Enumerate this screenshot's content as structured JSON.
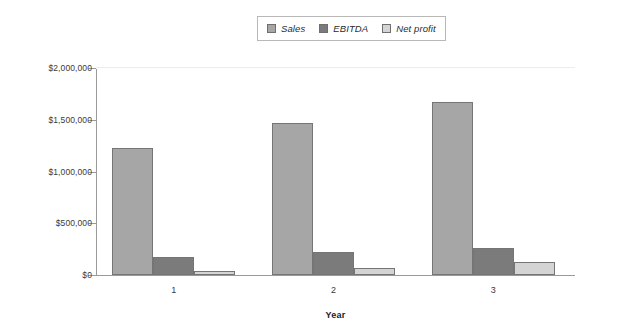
{
  "chart_data": {
    "type": "bar",
    "title": "",
    "xlabel": "Year",
    "ylabel": "",
    "categories": [
      "1",
      "2",
      "3"
    ],
    "series": [
      {
        "name": "Sales",
        "color": "#a6a6a6",
        "values": [
          1230000,
          1465000,
          1670000
        ]
      },
      {
        "name": "EBITDA",
        "color": "#7b7b7b",
        "values": [
          170000,
          225000,
          265000
        ]
      },
      {
        "name": "Net profit",
        "color": "#d4d4d4",
        "values": [
          40000,
          70000,
          125000
        ]
      }
    ],
    "ylim": [
      0,
      2000000
    ],
    "yticks": [
      0,
      500000,
      1000000,
      1500000,
      2000000
    ],
    "ytick_labels": [
      "$0",
      "$500,000",
      "$1,000,000",
      "$1,500,000",
      "$2,000,000"
    ],
    "gridlines": [
      2000000
    ],
    "grid": true,
    "legend_position": "top-center",
    "background": "#ffffff",
    "axis_color": "#9a9a9a",
    "gridline_color": "#e3f0ed"
  }
}
